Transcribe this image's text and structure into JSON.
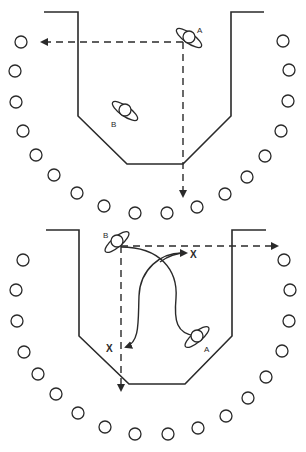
{
  "diagram": {
    "panels": [
      {
        "id": "top",
        "labels": {
          "player_a": "A",
          "player_b": "B"
        }
      },
      {
        "id": "bottom",
        "labels": {
          "player_a": "A",
          "player_b": "B",
          "target_1": "X",
          "target_2": "X"
        }
      }
    ],
    "colors": {
      "ink": "#2a2a2a",
      "background": "#ffffff"
    }
  }
}
